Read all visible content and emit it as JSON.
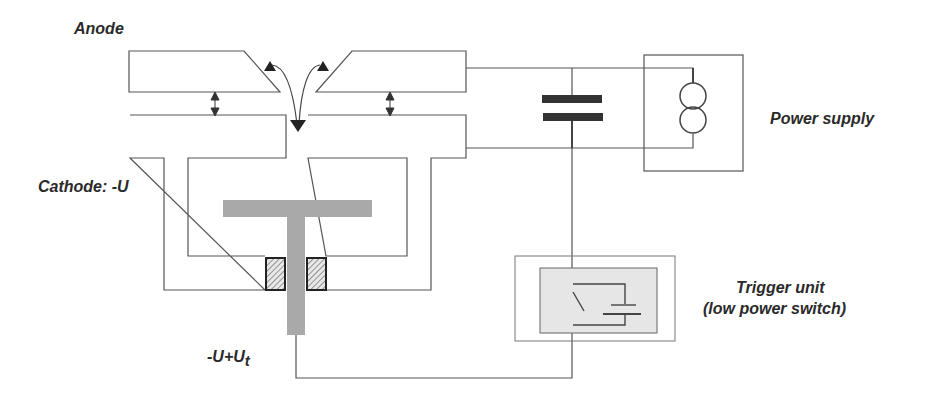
{
  "diagram": {
    "labels": {
      "anode": "Anode",
      "cathode": "Cathode: -U",
      "power_supply": "Power supply",
      "trigger_unit": "Trigger unit",
      "trigger_unit_sub": "(low power switch)",
      "trigger_voltage_main": "-U+U",
      "trigger_voltage_sub": "t"
    },
    "components": [
      {
        "id": "anode-left",
        "type": "electrode"
      },
      {
        "id": "anode-right",
        "type": "electrode"
      },
      {
        "id": "cathode-left",
        "type": "electrode"
      },
      {
        "id": "cathode-right",
        "type": "electrode"
      },
      {
        "id": "trigger-electrode",
        "type": "T-shaped electrode"
      },
      {
        "id": "insulator-left",
        "type": "hatched insulator"
      },
      {
        "id": "insulator-right",
        "type": "hatched insulator"
      },
      {
        "id": "capacitor",
        "type": "capacitor"
      },
      {
        "id": "current-source",
        "type": "power supply symbol"
      },
      {
        "id": "trigger-switch",
        "type": "switch with battery"
      }
    ],
    "colors": {
      "line": "#555555",
      "electrode_gray": "#a9a9a9",
      "capacitor_plate": "#333333",
      "trigger_fill": "#e6e6e6",
      "text": "#2a2a2a"
    }
  }
}
